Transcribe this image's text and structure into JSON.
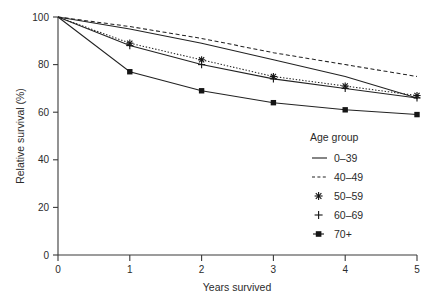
{
  "chart_data": {
    "type": "line",
    "title": "",
    "xlabel": "Years survived",
    "ylabel": "Relative survival (%)",
    "x": [
      0,
      1,
      2,
      3,
      4,
      5
    ],
    "xlim": [
      0,
      5
    ],
    "ylim": [
      0,
      100
    ],
    "xticks": [
      "0",
      "1",
      "2",
      "3",
      "4",
      "5"
    ],
    "yticks": [
      "0",
      "20",
      "40",
      "60",
      "80",
      "100"
    ],
    "grid": false,
    "legend_position": "right-inside",
    "legend_title": "Age group",
    "series": [
      {
        "name": "0–39",
        "label": "0–39",
        "marker": "none",
        "linestyle": "solid",
        "values": [
          100,
          95,
          89,
          82,
          75,
          66
        ]
      },
      {
        "name": "40–49",
        "label": "40–49",
        "marker": "none",
        "linestyle": "dashed",
        "values": [
          100,
          96,
          91,
          85,
          80,
          75
        ]
      },
      {
        "name": "50–59",
        "label": "50–59",
        "marker": "star",
        "linestyle": "dotted",
        "values": [
          100,
          89,
          82,
          75,
          71,
          67
        ]
      },
      {
        "name": "60–69",
        "label": "60–69",
        "marker": "plus",
        "linestyle": "solid",
        "values": [
          100,
          88,
          80,
          74,
          70,
          66
        ]
      },
      {
        "name": "70+",
        "label": "70+",
        "marker": "square",
        "linestyle": "solid",
        "values": [
          100,
          77,
          69,
          64,
          61,
          59
        ]
      }
    ]
  },
  "axes": {
    "x_title": "Years survived",
    "y_title": "Relative survival (%)",
    "x_tick_labels": [
      "0",
      "1",
      "2",
      "3",
      "4",
      "5"
    ],
    "y_tick_labels": [
      "0",
      "20",
      "40",
      "60",
      "80",
      "100"
    ]
  },
  "legend": {
    "title": "Age group",
    "items": [
      {
        "label": "0–39",
        "glyph": "line-solid-icon"
      },
      {
        "label": "40–49",
        "glyph": "line-dashed-icon"
      },
      {
        "label": "50–59",
        "glyph": "marker-star-icon"
      },
      {
        "label": "60–69",
        "glyph": "marker-plus-icon"
      },
      {
        "label": "70+",
        "glyph": "marker-square-icon"
      }
    ]
  },
  "colors": {
    "ink": "#222222",
    "background": "#ffffff"
  }
}
